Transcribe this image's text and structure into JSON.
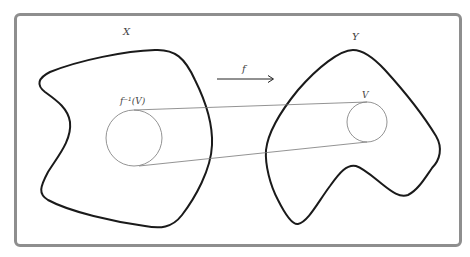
{
  "diagram": {
    "labels": {
      "domain_space": "X",
      "codomain_space": "Y",
      "map": "f",
      "preimage_set": "f⁻¹(V)",
      "open_set": "V"
    },
    "elements": [
      {
        "id": "space-x",
        "kind": "closed-curve",
        "label": "X"
      },
      {
        "id": "space-y",
        "kind": "closed-curve",
        "label": "Y"
      },
      {
        "id": "preimage-circle",
        "kind": "circle",
        "label": "f⁻¹(V)",
        "inside": "X"
      },
      {
        "id": "open-set-circle",
        "kind": "circle",
        "label": "V",
        "inside": "Y"
      },
      {
        "id": "map-arrow",
        "kind": "arrow",
        "label": "f",
        "from": "X",
        "to": "Y"
      },
      {
        "id": "connector-lines",
        "kind": "tangent-lines",
        "count": 2,
        "from": "preimage-circle",
        "to": "open-set-circle"
      }
    ],
    "colors": {
      "frame_border": "#8e8e8e",
      "shape_stroke": "#1a1a1a",
      "thin_stroke": "#777777",
      "label_text": "#444444"
    }
  }
}
